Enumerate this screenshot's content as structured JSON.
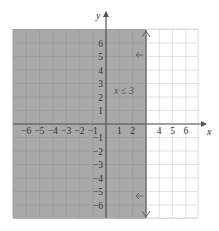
{
  "graph": {
    "x_axis_label": "x",
    "y_axis_label": "y",
    "x_ticks": [
      "-6",
      "-5",
      "-4",
      "-3",
      "-2",
      "-1",
      "1",
      "2",
      "4",
      "5",
      "6"
    ],
    "x_tick_values": [
      -6,
      -5,
      -4,
      -3,
      -2,
      -1,
      1,
      2,
      4,
      5,
      6
    ],
    "y_ticks_positive": [
      "6",
      "5",
      "4",
      "3",
      "2",
      "1"
    ],
    "y_ticks_negative": [
      "-1",
      "-2",
      "-3",
      "-4",
      "-5",
      "-6"
    ],
    "inequality_label": "x ≤ 3",
    "boundary_x": 3,
    "x_range": [
      -7,
      7
    ],
    "y_range": [
      -7,
      7
    ],
    "colors": {
      "shaded_region": "#a9a9a9",
      "grid_line_shaded": "#999999",
      "grid_line_unshaded": "#d4d4d4",
      "axis": "#555555",
      "boundary_line": "#666666",
      "background": "#ffffff"
    }
  }
}
